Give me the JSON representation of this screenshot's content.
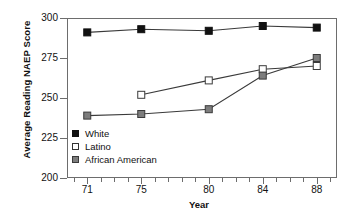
{
  "chart_data": {
    "type": "line",
    "title": "",
    "xlabel": "Year",
    "ylabel": "Average Reading NAEP Score",
    "x": [
      71,
      75,
      80,
      84,
      88
    ],
    "xtick_labels": [
      "71",
      "75",
      "80",
      "84",
      "88"
    ],
    "ytick_labels": [
      "200",
      "225",
      "250",
      "275",
      "300"
    ],
    "ytick_values": [
      200,
      225,
      250,
      275,
      300
    ],
    "xlim": [
      69.5,
      89.5
    ],
    "ylim": [
      200,
      300
    ],
    "x_minor_ticks": [
      70,
      71,
      72,
      73,
      74,
      75,
      76,
      77,
      78,
      79,
      80,
      81,
      82,
      83,
      84,
      85,
      86,
      87,
      88,
      89
    ],
    "grid": false,
    "legend_position": "lower-left-inside",
    "series": [
      {
        "name": "White",
        "marker": "filled-square",
        "color": "#111111",
        "x": [
          71,
          75,
          80,
          84,
          88
        ],
        "values": [
          291,
          293,
          292,
          295,
          294
        ]
      },
      {
        "name": "Latino",
        "marker": "open-square",
        "color": "#ffffff",
        "x": [
          75,
          80,
          84,
          88
        ],
        "values": [
          252,
          261,
          268,
          270
        ]
      },
      {
        "name": "African American",
        "marker": "gray-square",
        "color": "#7d7d7d",
        "x": [
          71,
          75,
          80,
          84,
          88
        ],
        "values": [
          239,
          240,
          243,
          264,
          275
        ]
      }
    ]
  },
  "legend": {
    "items": [
      {
        "label": "White"
      },
      {
        "label": "Latino"
      },
      {
        "label": "African American"
      }
    ]
  }
}
